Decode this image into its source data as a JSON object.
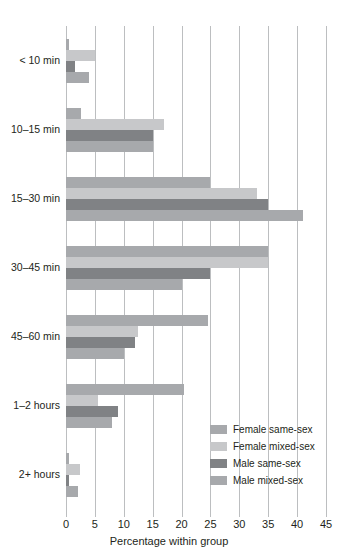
{
  "chart_data": {
    "type": "bar",
    "orientation": "horizontal",
    "title": "",
    "xlabel": "Percentage within group",
    "ylabel": "",
    "xlim": [
      0,
      45
    ],
    "xticks": [
      0,
      5,
      10,
      15,
      20,
      25,
      30,
      35,
      40,
      45
    ],
    "grid": true,
    "legend_position": "bottom-right",
    "categories": [
      "< 10 min",
      "10–15 min",
      "15–30 min",
      "30–45 min",
      "45–60 min",
      "1–2 hours",
      "2+ hours"
    ],
    "series": [
      {
        "name": "Female same-sex",
        "color": "#a7a9ac",
        "values": [
          0.6,
          2.6,
          25.0,
          35.0,
          24.5,
          20.5,
          0.5
        ]
      },
      {
        "name": "Female mixed-sex",
        "color": "#c7c8ca",
        "values": [
          5.0,
          17.0,
          33.0,
          35.0,
          12.5,
          5.5,
          2.4
        ]
      },
      {
        "name": "Male same-sex",
        "color": "#808285",
        "values": [
          1.5,
          15.0,
          35.0,
          25.0,
          12.0,
          9.0,
          0.6
        ]
      },
      {
        "name": "Male mixed-sex",
        "color": "#a7a9ac",
        "values": [
          4.0,
          15.0,
          41.0,
          20.0,
          10.0,
          8.0,
          2.0
        ]
      }
    ]
  },
  "axis": {
    "tick_labels": [
      "0",
      "5",
      "10",
      "15",
      "20",
      "25",
      "30",
      "35",
      "40",
      "45"
    ],
    "title": "Percentage within group"
  },
  "legend": {
    "items": [
      {
        "label": "Female same-sex",
        "color": "#a7a9ac"
      },
      {
        "label": "Female mixed-sex",
        "color": "#c7c8ca"
      },
      {
        "label": "Male same-sex",
        "color": "#808285"
      },
      {
        "label": "Male mixed-sex",
        "color": "#a7a9ac"
      }
    ]
  }
}
